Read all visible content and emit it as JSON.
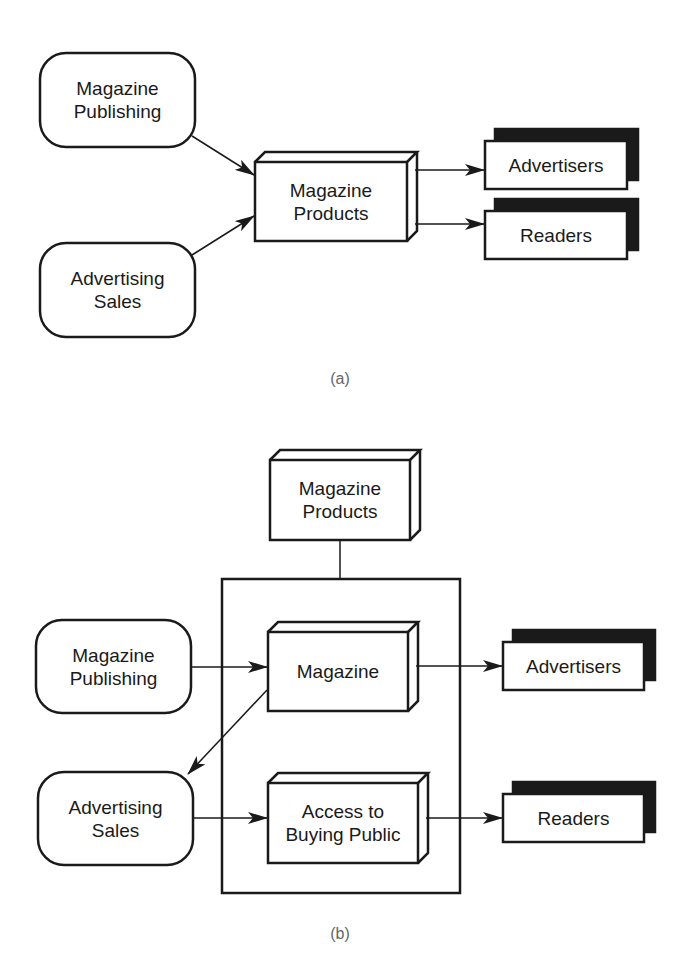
{
  "diagram_a": {
    "caption": "(a)",
    "nodes": {
      "magazine_publishing": "Magazine\nPublishing",
      "advertising_sales": "Advertising\nSales",
      "magazine_products": "Magazine\nProducts",
      "advertisers": "Advertisers",
      "readers": "Readers"
    },
    "edges": [
      {
        "from": "Magazine Publishing",
        "to": "Magazine Products"
      },
      {
        "from": "Advertising Sales",
        "to": "Magazine Products"
      },
      {
        "from": "Magazine Products",
        "to": "Advertisers"
      },
      {
        "from": "Magazine Products",
        "to": "Readers"
      }
    ]
  },
  "diagram_b": {
    "caption": "(b)",
    "nodes": {
      "magazine_products": "Magazine\nProducts",
      "magazine_publishing": "Magazine\nPublishing",
      "advertising_sales": "Advertising\nSales",
      "magazine": "Magazine",
      "access_to_buying_public": "Access to\nBuying Public",
      "advertisers": "Advertisers",
      "readers": "Readers"
    },
    "edges": [
      {
        "from": "Magazine Products",
        "to": "Product container",
        "type": "line"
      },
      {
        "from": "Magazine Publishing",
        "to": "Magazine"
      },
      {
        "from": "Magazine",
        "to": "Advertising Sales"
      },
      {
        "from": "Magazine",
        "to": "Advertisers"
      },
      {
        "from": "Advertising Sales",
        "to": "Access to Buying Public"
      },
      {
        "from": "Access to Buying Public",
        "to": "Readers"
      }
    ]
  },
  "colors": {
    "stroke": "#1a1a1a",
    "caption": "#666666",
    "background": "#ffffff"
  }
}
